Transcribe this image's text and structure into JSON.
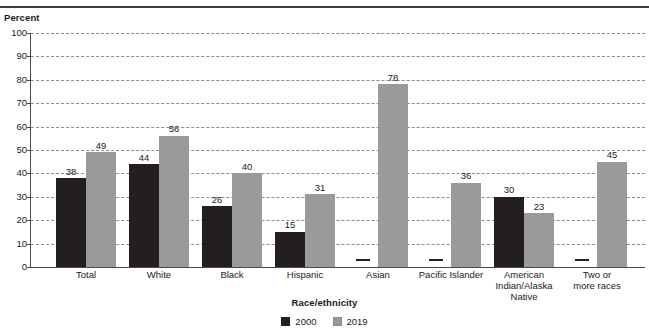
{
  "chart_data": {
    "type": "bar",
    "title": "",
    "xlabel": "Race/ethnicity",
    "ylabel": "Percent",
    "ylim": [
      0,
      100
    ],
    "ytick_step": 10,
    "yticks": [
      100,
      90,
      80,
      70,
      60,
      50,
      40,
      30,
      20,
      10,
      0
    ],
    "grid": true,
    "legend_position": "bottom",
    "missing_symbol": "—",
    "categories": [
      "Total",
      "White",
      "Black",
      "Hispanic",
      "Asian",
      "Pacific Islander",
      "American Indian/Alaska Native",
      "Two or more races"
    ],
    "category_lines": [
      [
        "Total"
      ],
      [
        "White"
      ],
      [
        "Black"
      ],
      [
        "Hispanic"
      ],
      [
        "Asian"
      ],
      [
        "Pacific Islander"
      ],
      [
        "American",
        "Indian/Alaska",
        "Native"
      ],
      [
        "Two or",
        "more races"
      ]
    ],
    "series": [
      {
        "name": "2000",
        "color": "#231f20",
        "values": [
          38,
          44,
          26,
          15,
          null,
          null,
          30,
          null
        ],
        "labels": [
          "38",
          "44",
          "26",
          "15",
          "—",
          "—",
          "30",
          "—"
        ]
      },
      {
        "name": "2019",
        "color": "#9a9a9a",
        "values": [
          49,
          56,
          40,
          31,
          78,
          36,
          23,
          45
        ],
        "labels": [
          "49",
          "56",
          "40",
          "31",
          "78",
          "36",
          "23",
          "45"
        ]
      }
    ]
  },
  "legend": {
    "items": [
      {
        "label": "2000",
        "color": "#231f20"
      },
      {
        "label": "2019",
        "color": "#9a9a9a"
      }
    ]
  }
}
